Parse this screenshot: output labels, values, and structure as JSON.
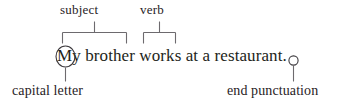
{
  "diagram": {
    "background_color": "#ffffff",
    "ink_color": "#231f20",
    "annotation_color": "#6d6a6e",
    "sentence": {
      "text": "My brother works at a restaurant.",
      "capital_letter": "M",
      "end_punctuation": "."
    },
    "callouts": {
      "subject": {
        "label": "subject",
        "position": "top",
        "target_text": "My brother"
      },
      "verb": {
        "label": "verb",
        "position": "top",
        "target_text": "works"
      },
      "capital_letter": {
        "label": "capital letter",
        "position": "bottom-left",
        "target_text": "M"
      },
      "end_punctuation": {
        "label": "end punctuation",
        "position": "bottom-right",
        "target_text": "."
      }
    },
    "markers": {
      "capital_letter_circle": "circle-marker",
      "end_punctuation_circle": "circle-marker",
      "subject_bracket": "bracket-marker",
      "verb_bracket": "bracket-marker"
    }
  }
}
